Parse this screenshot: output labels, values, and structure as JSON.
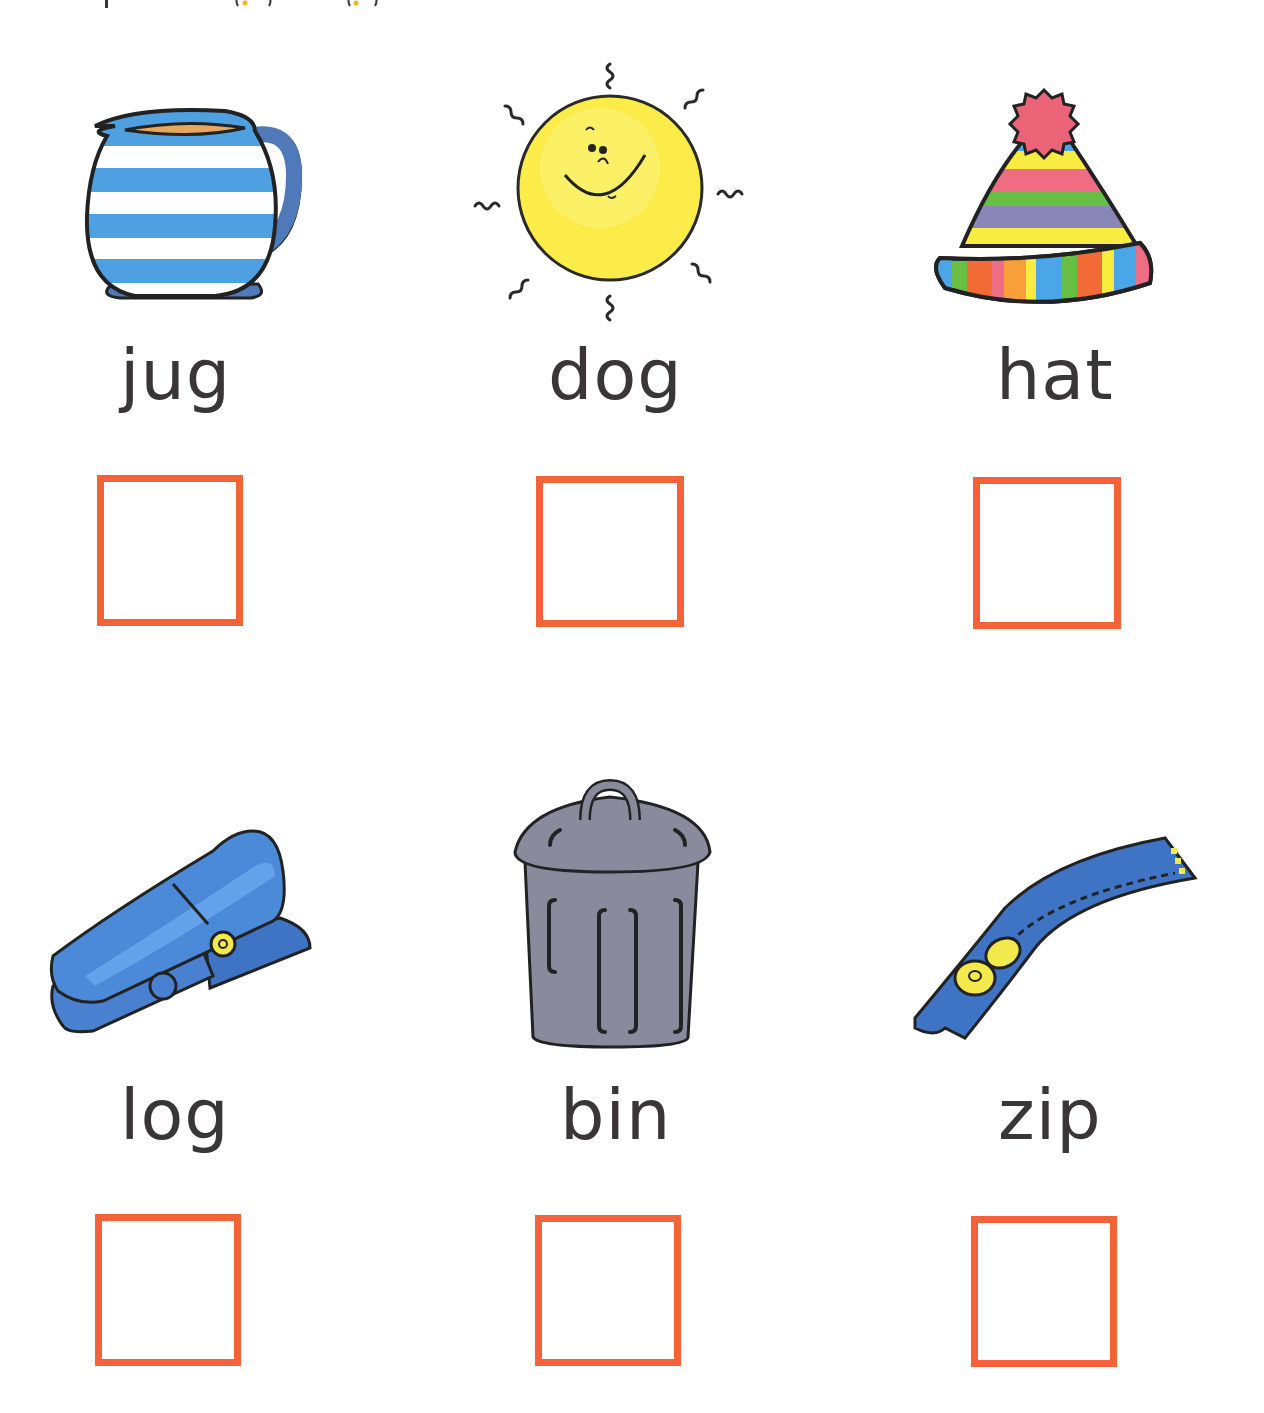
{
  "worksheet": {
    "accent_color": "#f4623a",
    "text_color": "#3a3536",
    "items": [
      {
        "word": "jug",
        "picture": "jug-icon"
      },
      {
        "word": "dog",
        "picture": "sun-icon"
      },
      {
        "word": "hat",
        "picture": "hat-icon"
      },
      {
        "word": "log",
        "picture": "clothes-peg-icon"
      },
      {
        "word": "bin",
        "picture": "bin-icon"
      },
      {
        "word": "zip",
        "picture": "zip-icon"
      }
    ]
  }
}
